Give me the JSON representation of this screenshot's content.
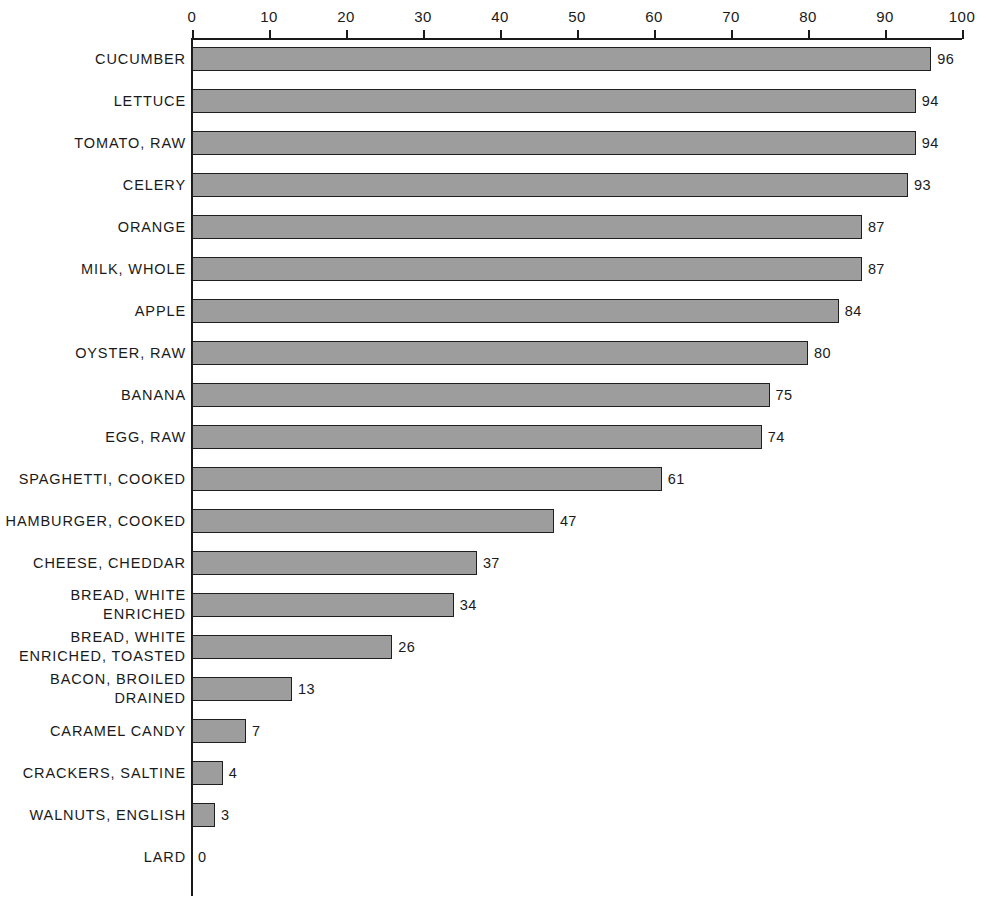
{
  "chart_data": {
    "type": "bar",
    "orientation": "horizontal",
    "title": "",
    "subtitle": "",
    "xlabel": "",
    "ylabel": "",
    "xlim": [
      0,
      100
    ],
    "grid": false,
    "legend": null,
    "bar_color": "#9d9d9d",
    "bar_border_color": "#1f1f1f",
    "axis_color": "#1a1a1a",
    "background_color": "#ffffff",
    "tick_labels": [
      "0",
      "10",
      "20",
      "30",
      "40",
      "50",
      "60",
      "70",
      "80",
      "90",
      "100"
    ],
    "tick_values": [
      0,
      10,
      20,
      30,
      40,
      50,
      60,
      70,
      80,
      90,
      100
    ],
    "categories": [
      "CUCUMBER",
      "LETTUCE",
      "TOMATO, RAW",
      "CELERY",
      "ORANGE",
      "MILK, WHOLE",
      "APPLE",
      "OYSTER, RAW",
      "BANANA",
      "EGG, RAW",
      "SPAGHETTI, COOKED",
      "HAMBURGER, COOKED",
      "CHEESE, CHEDDAR",
      "BREAD, WHITE ENRICHED",
      "BREAD, WHITE ENRICHED, TOASTED",
      "BACON, BROILED DRAINED",
      "CARAMEL CANDY",
      "CRACKERS, SALTINE",
      "WALNUTS, ENGLISH",
      "LARD"
    ],
    "values": [
      96,
      94,
      94,
      93,
      87,
      87,
      84,
      80,
      75,
      74,
      61,
      47,
      37,
      34,
      26,
      13,
      7,
      4,
      3,
      0
    ],
    "value_labels": [
      "96",
      "94",
      "94",
      "93",
      "87",
      "87",
      "84",
      "80",
      "75",
      "74",
      "61",
      "47",
      "37",
      "34",
      "26",
      "13",
      "7",
      "4",
      "3",
      "0"
    ],
    "rows": [
      {
        "label_lines": [
          "CUCUMBER"
        ],
        "value": 96,
        "value_label": "96"
      },
      {
        "label_lines": [
          "LETTUCE"
        ],
        "value": 94,
        "value_label": "94"
      },
      {
        "label_lines": [
          "TOMATO, RAW"
        ],
        "value": 94,
        "value_label": "94"
      },
      {
        "label_lines": [
          "CELERY"
        ],
        "value": 93,
        "value_label": "93"
      },
      {
        "label_lines": [
          "ORANGE"
        ],
        "value": 87,
        "value_label": "87"
      },
      {
        "label_lines": [
          "MILK, WHOLE"
        ],
        "value": 87,
        "value_label": "87"
      },
      {
        "label_lines": [
          "APPLE"
        ],
        "value": 84,
        "value_label": "84"
      },
      {
        "label_lines": [
          "OYSTER, RAW"
        ],
        "value": 80,
        "value_label": "80"
      },
      {
        "label_lines": [
          "BANANA"
        ],
        "value": 75,
        "value_label": "75"
      },
      {
        "label_lines": [
          "EGG, RAW"
        ],
        "value": 74,
        "value_label": "74"
      },
      {
        "label_lines": [
          "SPAGHETTI, COOKED"
        ],
        "value": 61,
        "value_label": "61"
      },
      {
        "label_lines": [
          "HAMBURGER, COOKED"
        ],
        "value": 47,
        "value_label": "47"
      },
      {
        "label_lines": [
          "CHEESE, CHEDDAR"
        ],
        "value": 37,
        "value_label": "37"
      },
      {
        "label_lines": [
          "BREAD, WHITE",
          "ENRICHED"
        ],
        "value": 34,
        "value_label": "34"
      },
      {
        "label_lines": [
          "BREAD, WHITE",
          "ENRICHED, TOASTED"
        ],
        "value": 26,
        "value_label": "26"
      },
      {
        "label_lines": [
          "BACON, BROILED",
          "DRAINED"
        ],
        "value": 13,
        "value_label": "13"
      },
      {
        "label_lines": [
          "CARAMEL CANDY"
        ],
        "value": 7,
        "value_label": "7"
      },
      {
        "label_lines": [
          "CRACKERS, SALTINE"
        ],
        "value": 4,
        "value_label": "4"
      },
      {
        "label_lines": [
          "WALNUTS, ENGLISH"
        ],
        "value": 3,
        "value_label": "3"
      },
      {
        "label_lines": [
          "LARD"
        ],
        "value": 0,
        "value_label": "0"
      }
    ]
  }
}
